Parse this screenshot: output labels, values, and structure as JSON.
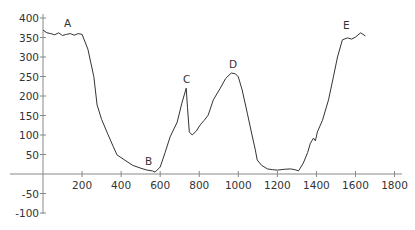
{
  "chart_data": {
    "type": "line",
    "title": "",
    "xlabel": "",
    "ylabel": "",
    "xlim": [
      -50,
      1800
    ],
    "ylim": [
      -100,
      400
    ],
    "grid": false,
    "legend": null,
    "x_ticks": [
      200,
      400,
      600,
      800,
      1000,
      1200,
      1400,
      1600,
      1800
    ],
    "y_ticks": [
      400,
      350,
      300,
      250,
      200,
      150,
      100,
      50,
      -50,
      -100
    ],
    "series": [
      {
        "name": "profile",
        "x": [
          0,
          20,
          40,
          60,
          80,
          100,
          120,
          140,
          160,
          180,
          200,
          230,
          260,
          277,
          300,
          330,
          360,
          379,
          420,
          460,
          500,
          533,
          560,
          574,
          600,
          625,
          651,
          687,
          710,
          733,
          740,
          749,
          764,
          785,
          805,
          826,
          846,
          872,
          890,
          908,
          935,
          964,
          985,
          1000,
          1020,
          1046,
          1070,
          1087,
          1097,
          1120,
          1149,
          1175,
          1200,
          1235,
          1267,
          1290,
          1308,
          1333,
          1355,
          1369,
          1385,
          1395,
          1405,
          1431,
          1462,
          1487,
          1508,
          1533,
          1559,
          1580,
          1600,
          1626,
          1651
        ],
        "y": [
          369,
          362,
          360,
          357,
          362,
          355,
          358,
          360,
          356,
          360,
          358,
          320,
          250,
          177,
          140,
          105,
          70,
          49,
          35,
          22,
          15,
          10,
          8,
          5,
          18,
          55,
          95,
          133,
          180,
          220,
          170,
          108,
          100,
          110,
          126,
          138,
          151,
          190,
          205,
          220,
          245,
          259,
          257,
          249,
          215,
          156,
          100,
          62,
          36,
          22,
          13,
          11,
          10,
          12,
          13,
          11,
          8,
          28,
          55,
          79,
          92,
          85,
          108,
          138,
          190,
          249,
          300,
          344,
          349,
          346,
          351,
          362,
          354
        ]
      }
    ],
    "annotations": [
      {
        "label": "A",
        "x": 160,
        "y": 380
      },
      {
        "label": "B",
        "x": 545,
        "y": 15
      },
      {
        "label": "C",
        "x": 735,
        "y": 240
      },
      {
        "label": "D",
        "x": 975,
        "y": 275
      },
      {
        "label": "E",
        "x": 1555,
        "y": 375
      }
    ]
  },
  "axes": {
    "x_tick_labels": [
      "200",
      "400",
      "600",
      "800",
      "1000",
      "1200",
      "1400",
      "1600",
      "1800"
    ],
    "y_tick_labels": [
      "400",
      "350",
      "300",
      "250",
      "200",
      "150",
      "100",
      "50",
      "-50",
      "-100"
    ]
  },
  "labels": {
    "A": "A",
    "B": "B",
    "C": "C",
    "D": "D",
    "E": "E"
  }
}
